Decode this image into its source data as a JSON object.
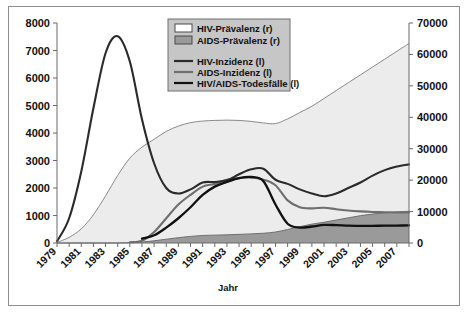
{
  "figure": {
    "axis_title_x": "Jahr"
  },
  "chart_data": {
    "type": "area",
    "title": "",
    "subtitle": "",
    "xlabel": "Jahr",
    "ylabel": "",
    "ylabel_right": "",
    "grid": false,
    "legend_position": "top-center",
    "x": [
      1979,
      1980,
      1981,
      1982,
      1983,
      1984,
      1985,
      1986,
      1987,
      1988,
      1989,
      1990,
      1991,
      1992,
      1993,
      1994,
      1995,
      1996,
      1997,
      1998,
      1999,
      2000,
      2001,
      2002,
      2003,
      2004,
      2005,
      2006,
      2007,
      2008
    ],
    "xtick_labels": [
      "1979",
      "1981",
      "1983",
      "1985",
      "1987",
      "1989",
      "1991",
      "1993",
      "1995",
      "1997",
      "1999",
      "2001",
      "2003",
      "2005",
      "2007"
    ],
    "xlim": [
      1979,
      2008
    ],
    "ylim_left": [
      0,
      8000
    ],
    "ylim_right": [
      0,
      70000
    ],
    "ytick_labels_left": [
      "0",
      "1000",
      "2000",
      "3000",
      "4000",
      "5000",
      "6000",
      "7000",
      "8000"
    ],
    "ytick_labels_right": [
      "0",
      "10000",
      "20000",
      "30000",
      "40000",
      "50000",
      "60000",
      "70000"
    ],
    "colors": {
      "hiv_praevalenz_fill": "#ececec",
      "aids_praevalenz_fill": "#9a9a9a",
      "hiv_inzidenz_line": "#2a2a2a",
      "aids_inzidenz_line": "#6e6e6e",
      "todesfaelle_line": "#111111",
      "legend_bg": "#c6c6c6",
      "frame": "#8d8d8d"
    },
    "series": [
      {
        "name": "HIV-Prävalenz (r)",
        "axis": "right",
        "kind": "area",
        "values": [
          200,
          1800,
          4500,
          9000,
          15000,
          21500,
          27000,
          30500,
          33000,
          35500,
          37200,
          38300,
          38800,
          39000,
          39100,
          39000,
          38700,
          38200,
          38000,
          39500,
          41500,
          43500,
          46000,
          48500,
          51000,
          53500,
          56000,
          58500,
          61000,
          63500
        ]
      },
      {
        "name": "AIDS-Prävalenz (r)",
        "axis": "right",
        "kind": "area",
        "values": [
          0,
          0,
          0,
          0,
          0,
          0,
          100,
          300,
          700,
          1200,
          1700,
          2100,
          2400,
          2500,
          2600,
          2750,
          2900,
          3100,
          3500,
          4300,
          5200,
          6000,
          6600,
          7300,
          8000,
          8700,
          9200,
          9600,
          9900,
          10100
        ]
      },
      {
        "name": "HIV-Inzidenz (l)",
        "axis": "left",
        "kind": "line",
        "values": [
          60,
          900,
          2600,
          4900,
          6900,
          7520,
          6600,
          4500,
          2900,
          2000,
          1800,
          1950,
          2200,
          2220,
          2280,
          2500,
          2680,
          2700,
          2300,
          2150,
          1950,
          1800,
          1700,
          1800,
          2000,
          2200,
          2450,
          2650,
          2780,
          2860
        ]
      },
      {
        "name": "AIDS-Inzidenz (l)",
        "axis": "left",
        "kind": "line",
        "values": [
          0,
          0,
          0,
          0,
          0,
          0,
          30,
          80,
          400,
          900,
          1400,
          1750,
          2050,
          2150,
          2300,
          2360,
          2380,
          2300,
          2100,
          1550,
          1300,
          1260,
          1280,
          1230,
          1180,
          1150,
          1130,
          1120,
          1110,
          1110
        ]
      },
      {
        "name": "HIV/AIDS-Todesfälle (l)",
        "axis": "left",
        "kind": "line",
        "values": [
          0,
          0,
          0,
          0,
          0,
          0,
          0,
          160,
          280,
          560,
          900,
          1300,
          1750,
          2050,
          2220,
          2360,
          2400,
          2250,
          1400,
          700,
          560,
          600,
          660,
          650,
          630,
          620,
          625,
          630,
          635,
          640
        ]
      }
    ],
    "annotations": []
  },
  "legend": {
    "items": [
      {
        "label": "HIV-Prävalenz (r)",
        "marker": "swatch",
        "swatch_fill": "#ffffff"
      },
      {
        "label": "AIDS-Prävalenz (r)",
        "marker": "swatch",
        "swatch_fill": "#9a9a9a"
      },
      {
        "label": "HIV-Inzidenz (l)",
        "marker": "line",
        "line_color": "#2a2a2a"
      },
      {
        "label": "AIDS-Inzidenz (l)",
        "marker": "line",
        "line_color": "#6e6e6e"
      },
      {
        "label": "HIV/AIDS-Todesfälle (l)",
        "marker": "line",
        "line_color": "#111111"
      }
    ]
  }
}
